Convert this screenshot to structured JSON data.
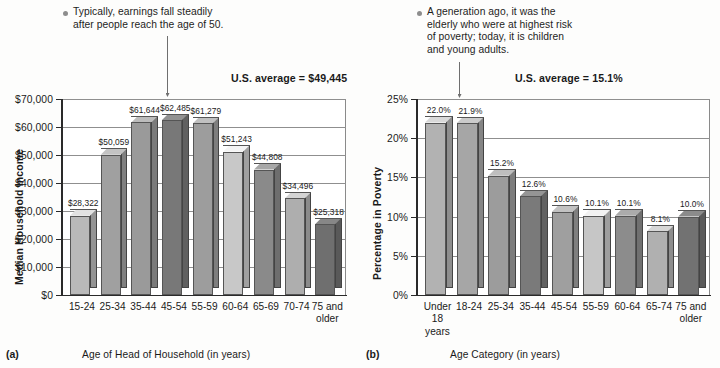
{
  "chart_data": [
    {
      "id": "a",
      "type": "bar",
      "panel_letter": "(a)",
      "title": "",
      "xlabel": "Age of Head of Household (in years)",
      "ylabel": "Median Household Income",
      "categories": [
        "15-24",
        "25-34",
        "35-44",
        "45-54",
        "55-59",
        "60-64",
        "65-69",
        "70-74",
        "75 and\nolder"
      ],
      "values": [
        28322,
        50059,
        61644,
        62485,
        61279,
        51243,
        44808,
        34496,
        25318
      ],
      "value_labels": [
        "$28,322",
        "$50,059",
        "$61,644",
        "$62,485",
        "$61,279",
        "$51,243",
        "$44,808",
        "$34,496",
        "$25,318"
      ],
      "ylim": [
        0,
        70000
      ],
      "ytick_values": [
        0,
        10000,
        20000,
        30000,
        40000,
        50000,
        60000,
        70000
      ],
      "ytick_labels": [
        "$0",
        "$10,000",
        "$20,000",
        "$30,000",
        "$40,000",
        "$50,000",
        "$60,000",
        "$70,000"
      ],
      "grid": true,
      "legend": "none",
      "bar_shades": [
        "#b9b9b9",
        "#a0a0a0",
        "#9a9a9a",
        "#787878",
        "#9d9d9d",
        "#c8c8c8",
        "#8a8a8a",
        "#aeaeae",
        "#6f6f6f"
      ],
      "annotation": {
        "text": "Typically, earnings fall steadily\nafter people reach the age of 50.",
        "leader_target_category": "45-54"
      },
      "average_note": "U.S. average = $49,445"
    },
    {
      "id": "b",
      "type": "bar",
      "panel_letter": "(b)",
      "title": "",
      "xlabel": "Age Category (in years)",
      "ylabel": "Percentage in Poverty",
      "categories": [
        "Under\n18\nyears",
        "18-24",
        "25-34",
        "35-44",
        "45-54",
        "55-59",
        "60-64",
        "65-74",
        "75 and\nolder"
      ],
      "values": [
        22.0,
        21.9,
        15.2,
        12.6,
        10.6,
        10.1,
        10.1,
        8.1,
        10.0
      ],
      "value_labels": [
        "22.0%",
        "21.9%",
        "15.2%",
        "12.6%",
        "10.6%",
        "10.1%",
        "10.1%",
        "8.1%",
        "10.0%"
      ],
      "ylim": [
        0,
        25
      ],
      "ytick_values": [
        0,
        5,
        10,
        15,
        20,
        25
      ],
      "ytick_labels": [
        "0%",
        "5%",
        "10%",
        "15%",
        "20%",
        "25%"
      ],
      "grid": true,
      "legend": "none",
      "bar_shades": [
        "#b2b2b2",
        "#a6a6a6",
        "#9c9c9c",
        "#7a7a7a",
        "#9f9f9f",
        "#c6c6c6",
        "#8c8c8c",
        "#b0b0b0",
        "#727272"
      ],
      "annotation": {
        "text": "A generation ago, it was the\nelderly who were at highest risk\nof poverty; today, it is children\nand young adults.",
        "leader_target_category": "18-24"
      },
      "average_note": "U.S. average = 15.1%"
    }
  ]
}
